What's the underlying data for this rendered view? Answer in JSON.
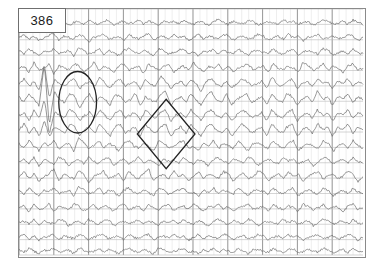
{
  "page": {
    "page_label": "386",
    "background_color": "#ffffff",
    "footer_note": ""
  },
  "frame": {
    "border_color": "#8a8a8a",
    "x": 18,
    "y": 8,
    "width": 348,
    "height": 250
  },
  "grid": {
    "minor_vertical_color": "#e2e2e2",
    "major_vertical_color": "#8f8f8f",
    "horizontal_color": "#b8b8b8",
    "minor_vertical_spacing": 7,
    "major_vertical_spacing": 35,
    "channel_row_height": 15.6,
    "channel_count": 16
  },
  "traces": {
    "color": "#6b6b6b",
    "line_width": 0.7,
    "label": "EEG channel waveforms"
  },
  "annotations": [
    {
      "name": "ellipse-annotation",
      "shape": "ellipse",
      "cx": 78,
      "cy": 103,
      "rx": 19,
      "ry": 31,
      "color": "#222222",
      "stroke_width": 1.3,
      "description": "circled spike discharge"
    },
    {
      "name": "diamond-annotation",
      "shape": "diamond",
      "cx": 167,
      "cy": 135,
      "half_width": 29,
      "half_height": 35,
      "color": "#222222",
      "stroke_width": 1.3,
      "description": "diamond-marked rhythmic burst"
    }
  ],
  "chart_data": {
    "type": "line",
    "xlabel": "",
    "ylabel": "",
    "grid": true,
    "legend_position": "none",
    "x_range": [
      0,
      348
    ],
    "channel_count": 16,
    "series": [
      {
        "name": "Ch1",
        "baseline": 14,
        "amplitude": 3.2,
        "values": [
          0,
          1,
          -1,
          2,
          -2,
          1,
          0,
          -1,
          2,
          1,
          -2,
          0,
          1,
          -1,
          2,
          0,
          -1,
          1,
          2,
          -2,
          0,
          1,
          -1,
          0,
          2,
          -1,
          1,
          0,
          -2,
          1,
          0,
          1,
          -1,
          2,
          0,
          -1,
          1,
          0,
          -2,
          1,
          2,
          0,
          -1,
          1,
          0,
          -1,
          2,
          1,
          -2,
          0,
          1,
          0,
          -1,
          2,
          0,
          1,
          -1,
          0,
          1,
          -2,
          0,
          2,
          1,
          -1,
          0,
          1,
          -1,
          2,
          0,
          -1
        ]
      },
      {
        "name": "Ch2",
        "baseline": 29,
        "amplitude": 3.5,
        "values": [
          0,
          2,
          -1,
          1,
          -2,
          0,
          1,
          3,
          -2,
          1,
          0,
          -1,
          2,
          1,
          -3,
          0,
          1,
          2,
          -1,
          0,
          1,
          -2,
          2,
          0,
          -1,
          1,
          3,
          -2,
          0,
          1,
          -1,
          2,
          0,
          1,
          -2,
          0,
          2,
          -1,
          1,
          0,
          -1,
          2,
          1,
          -2,
          0,
          1,
          -1,
          0,
          2,
          1,
          -2,
          0,
          1,
          -1,
          2,
          0,
          1,
          -2,
          0,
          1,
          2,
          -1,
          0,
          1,
          -1,
          0,
          2,
          1,
          -2,
          0
        ]
      },
      {
        "name": "Ch3",
        "baseline": 44,
        "amplitude": 4.0,
        "values": [
          1,
          -1,
          2,
          0,
          -2,
          1,
          0,
          2,
          -1,
          0,
          1,
          -2,
          3,
          1,
          -1,
          0,
          2,
          -1,
          1,
          0,
          -2,
          1,
          2,
          0,
          -1,
          1,
          0,
          -2,
          2,
          1,
          -1,
          0,
          1,
          2,
          -1,
          0,
          -2,
          1,
          0,
          2,
          -1,
          1,
          0,
          -1,
          2,
          0,
          -2,
          1,
          1,
          0,
          -1,
          2,
          0,
          -1,
          1,
          2,
          -2,
          0,
          1,
          0,
          -1,
          2,
          1,
          -2,
          0,
          1,
          -1,
          2,
          0,
          -1
        ]
      },
      {
        "name": "Ch4",
        "baseline": 60,
        "amplitude": 4.5,
        "values": [
          0,
          1,
          -2,
          3,
          -1,
          0,
          2,
          -3,
          1,
          0,
          -1,
          2,
          1,
          -2,
          0,
          3,
          -1,
          1,
          0,
          -2,
          1,
          2,
          -1,
          0,
          1,
          -3,
          2,
          0,
          -1,
          1,
          2,
          -2,
          0,
          1,
          -1,
          3,
          0,
          -2,
          1,
          0,
          2,
          -1,
          1,
          -2,
          0,
          1,
          2,
          -1,
          0,
          1,
          -2,
          2,
          0,
          -1,
          1,
          0,
          -2,
          3,
          1,
          -1,
          0,
          2,
          -1,
          1,
          0,
          -2,
          1,
          2,
          -1,
          0
        ]
      },
      {
        "name": "Ch5",
        "baseline": 76,
        "amplitude": 5.5,
        "values": [
          0,
          2,
          -1,
          1,
          -3,
          8,
          -6,
          2,
          0,
          -1,
          1,
          2,
          -2,
          0,
          1,
          -1,
          3,
          0,
          -2,
          1,
          2,
          -1,
          0,
          1,
          -2,
          2,
          0,
          -1,
          3,
          1,
          -2,
          0,
          1,
          -1,
          2,
          0,
          -3,
          1,
          2,
          0,
          -1,
          1,
          -2,
          0,
          2,
          1,
          -1,
          0,
          1,
          -2,
          3,
          0,
          -1,
          1,
          2,
          -2,
          0,
          1,
          -1,
          2,
          0,
          1,
          -2,
          1,
          0,
          2,
          -1,
          1,
          0
        ]
      },
      {
        "name": "Ch6",
        "baseline": 92,
        "amplitude": 6.5,
        "values": [
          1,
          -1,
          2,
          0,
          -2,
          12,
          -9,
          3,
          0,
          -1,
          2,
          1,
          -3,
          0,
          2,
          -1,
          1,
          0,
          -2,
          2,
          1,
          -1,
          0,
          2,
          -2,
          1,
          0,
          -1,
          2,
          3,
          -2,
          0,
          1,
          -1,
          2,
          0,
          -2,
          1,
          3,
          0,
          -1,
          2,
          -2,
          0,
          1,
          2,
          -1,
          0,
          1,
          -2,
          2,
          0,
          -1,
          2,
          1,
          -2,
          0,
          1,
          -1,
          3,
          0,
          1,
          -2,
          1,
          0,
          2,
          -1,
          1,
          0
        ]
      },
      {
        "name": "Ch7",
        "baseline": 108,
        "amplitude": 6.0,
        "values": [
          0,
          1,
          -2,
          2,
          -1,
          6,
          -7,
          1,
          0,
          -1,
          2,
          1,
          -2,
          0,
          1,
          -1,
          2,
          0,
          -2,
          1,
          2,
          -1,
          0,
          1,
          -2,
          2,
          0,
          -1,
          1,
          2,
          -2,
          0,
          1,
          -1,
          2,
          0,
          -2,
          1,
          2,
          0,
          -1,
          1,
          -2,
          0,
          2,
          1,
          -1,
          0,
          1,
          -2,
          2,
          0,
          -1,
          1,
          2,
          -2,
          0,
          1,
          -1,
          2,
          0,
          1,
          -2,
          1,
          0,
          2,
          -1,
          1,
          0
        ]
      },
      {
        "name": "Ch8",
        "baseline": 123,
        "amplitude": 7.0,
        "values": [
          0,
          2,
          -1,
          1,
          -2,
          3,
          -2,
          1,
          0,
          -1,
          2,
          1,
          -2,
          0,
          1,
          -1,
          2,
          0,
          -2,
          1,
          2,
          -1,
          0,
          1,
          -2,
          2,
          0,
          -1,
          1,
          2,
          -2,
          0,
          1,
          -1,
          2,
          0,
          -2,
          1,
          2,
          0,
          -1,
          1,
          -2,
          0,
          2,
          1,
          -1,
          0,
          1,
          -2,
          2,
          0,
          -1,
          1,
          2,
          -2,
          0,
          1,
          -1,
          2,
          0,
          1,
          -2,
          1,
          0,
          2,
          -1,
          1,
          0
        ]
      },
      {
        "name": "Ch9",
        "baseline": 139,
        "amplitude": 6.0,
        "values": [
          1,
          -1,
          2,
          0,
          -2,
          1,
          0,
          2,
          -1,
          0,
          1,
          -2,
          3,
          1,
          -1,
          0,
          2,
          -1,
          1,
          0,
          -2,
          1,
          2,
          0,
          -1,
          1,
          0,
          -2,
          2,
          1,
          -1,
          0,
          1,
          2,
          -1,
          0,
          -2,
          1,
          0,
          2,
          -1,
          1,
          0,
          -1,
          2,
          0,
          -2,
          1,
          1,
          0,
          -1,
          2,
          0,
          -1,
          1,
          2,
          -2,
          0,
          1,
          0,
          -1,
          2,
          1,
          -2,
          0,
          1,
          -1,
          2,
          0,
          -1
        ]
      },
      {
        "name": "Ch10",
        "baseline": 155,
        "amplitude": 5.0,
        "values": [
          0,
          1,
          -1,
          2,
          -2,
          1,
          0,
          -1,
          2,
          1,
          -2,
          0,
          1,
          -1,
          2,
          0,
          -1,
          1,
          2,
          -2,
          0,
          1,
          -1,
          0,
          2,
          -1,
          1,
          0,
          -2,
          1,
          0,
          1,
          -1,
          2,
          0,
          -1,
          1,
          0,
          -2,
          1,
          2,
          0,
          -1,
          1,
          0,
          -1,
          2,
          1,
          -2,
          0,
          1,
          0,
          -1,
          2,
          0,
          1,
          -1,
          0,
          1,
          -2,
          0,
          2,
          1,
          -1,
          0,
          1,
          -1,
          2,
          0,
          -1
        ]
      },
      {
        "name": "Ch11",
        "baseline": 170,
        "amplitude": 5.5,
        "values": [
          0,
          2,
          -1,
          1,
          -2,
          0,
          1,
          3,
          -2,
          1,
          0,
          -1,
          2,
          1,
          -3,
          0,
          1,
          2,
          -1,
          0,
          1,
          -2,
          2,
          0,
          -1,
          1,
          3,
          -2,
          0,
          1,
          -1,
          2,
          0,
          1,
          -2,
          0,
          2,
          -1,
          1,
          0,
          -1,
          2,
          1,
          -2,
          0,
          1,
          -1,
          0,
          2,
          1,
          -2,
          0,
          1,
          -1,
          2,
          0,
          1,
          -2,
          0,
          1,
          2,
          -1,
          0,
          1,
          -1,
          0,
          2,
          1,
          -2,
          0
        ]
      },
      {
        "name": "Ch12",
        "baseline": 186,
        "amplitude": 4.5,
        "values": [
          1,
          -1,
          2,
          0,
          -2,
          1,
          0,
          2,
          -1,
          0,
          1,
          -2,
          3,
          1,
          -1,
          0,
          2,
          -1,
          1,
          0,
          -2,
          1,
          2,
          0,
          -1,
          1,
          0,
          -2,
          2,
          1,
          -1,
          0,
          1,
          2,
          -1,
          0,
          -2,
          1,
          0,
          2,
          -1,
          1,
          0,
          -1,
          2,
          0,
          -2,
          1,
          1,
          0,
          -1,
          2,
          0,
          -1,
          1,
          2,
          -2,
          0,
          1,
          0,
          -1,
          2,
          1,
          -2,
          0,
          1,
          -1,
          2,
          0,
          -1
        ]
      },
      {
        "name": "Ch13",
        "baseline": 202,
        "amplitude": 4.0,
        "values": [
          0,
          1,
          -2,
          2,
          -1,
          0,
          2,
          -2,
          1,
          0,
          -1,
          2,
          1,
          -2,
          0,
          2,
          -1,
          1,
          0,
          -2,
          1,
          2,
          -1,
          0,
          1,
          -2,
          2,
          0,
          -1,
          1,
          2,
          -2,
          0,
          1,
          -1,
          2,
          0,
          -2,
          1,
          0,
          2,
          -1,
          1,
          -2,
          0,
          1,
          2,
          -1,
          0,
          1,
          -2,
          2,
          0,
          -1,
          1,
          0,
          -2,
          2,
          1,
          -1,
          0,
          2,
          -1,
          1,
          0,
          -2,
          1,
          2,
          -1,
          0
        ]
      },
      {
        "name": "Ch14",
        "baseline": 217,
        "amplitude": 3.6,
        "values": [
          0,
          1,
          -1,
          2,
          -2,
          1,
          0,
          -1,
          2,
          1,
          -2,
          0,
          1,
          -1,
          2,
          0,
          -1,
          1,
          2,
          -2,
          0,
          1,
          -1,
          0,
          2,
          -1,
          1,
          0,
          -2,
          1,
          0,
          1,
          -1,
          2,
          0,
          -1,
          1,
          0,
          -2,
          1,
          2,
          0,
          -1,
          1,
          0,
          -1,
          2,
          1,
          -2,
          0,
          1,
          0,
          -1,
          2,
          0,
          1,
          -1,
          0,
          1,
          -2,
          0,
          2,
          1,
          -1,
          0,
          1,
          -1,
          2,
          0,
          -1
        ]
      },
      {
        "name": "Ch15",
        "baseline": 232,
        "amplitude": 3.2,
        "values": [
          0,
          2,
          -1,
          1,
          -2,
          0,
          1,
          2,
          -2,
          1,
          0,
          -1,
          2,
          1,
          -2,
          0,
          1,
          2,
          -1,
          0,
          1,
          -2,
          2,
          0,
          -1,
          1,
          2,
          -2,
          0,
          1,
          -1,
          2,
          0,
          1,
          -2,
          0,
          2,
          -1,
          1,
          0,
          -1,
          2,
          1,
          -2,
          0,
          1,
          -1,
          0,
          2,
          1,
          -2,
          0,
          1,
          -1,
          2,
          0,
          1,
          -2,
          0,
          1,
          2,
          -1,
          0,
          1,
          -1,
          0,
          2,
          1,
          -2,
          0
        ]
      },
      {
        "name": "Ch16",
        "baseline": 246,
        "amplitude": 3.0,
        "values": [
          1,
          -1,
          2,
          0,
          -2,
          1,
          0,
          2,
          -1,
          0,
          1,
          -2,
          2,
          1,
          -1,
          0,
          2,
          -1,
          1,
          0,
          -2,
          1,
          2,
          0,
          -1,
          1,
          0,
          -2,
          2,
          1,
          -1,
          0,
          1,
          2,
          -1,
          0,
          -2,
          1,
          0,
          2,
          -1,
          1,
          0,
          -1,
          2,
          0,
          -2,
          1,
          1,
          0,
          -1,
          2,
          0,
          -1,
          1,
          2,
          -2,
          0,
          1,
          0,
          -1,
          2,
          1,
          -2,
          0,
          1,
          -1,
          2,
          0,
          -1
        ]
      }
    ]
  }
}
